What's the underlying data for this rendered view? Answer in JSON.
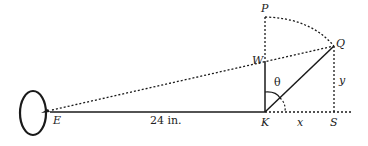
{
  "diagram": {
    "points": {
      "E": {
        "label": "E",
        "x": 52,
        "y": 112
      },
      "K": {
        "label": "K",
        "x": 265,
        "y": 112
      },
      "S": {
        "label": "S",
        "x": 334,
        "y": 112
      },
      "P": {
        "label": "P",
        "x": 265,
        "y": 17
      },
      "Q": {
        "label": "Q",
        "x": 334,
        "y": 46
      },
      "W": {
        "label": "W",
        "x": 265,
        "y": 62
      }
    },
    "labels": {
      "distance": "24 in.",
      "angle": "θ",
      "x": "x",
      "y": "y"
    },
    "colors": {
      "stroke": "#1a1a1a",
      "background": "#ffffff"
    }
  }
}
